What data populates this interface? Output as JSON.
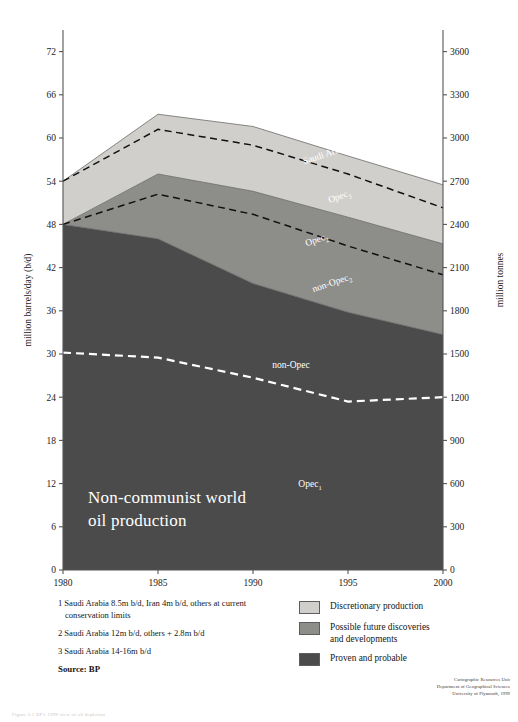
{
  "figure": {
    "source_label": "Source: BP",
    "caption": "Figure 2.1  BP's 1999 view of oil depletion"
  },
  "credit": {
    "line1": "Cartographic Resources Unit",
    "line2": "Department of Geographical Sciences",
    "line3": "University of Plymouth, 1999"
  },
  "axes": {
    "left_title": "million barrels/day (b/d)",
    "right_title": "million tonnes",
    "left_ticks": [
      "0",
      "6",
      "12",
      "18",
      "24",
      "30",
      "36",
      "42",
      "48",
      "54",
      "60",
      "66",
      "72"
    ],
    "right_ticks": [
      "0",
      "300",
      "600",
      "900",
      "1200",
      "1500",
      "1800",
      "2100",
      "2400",
      "2700",
      "3000",
      "3300",
      "3600"
    ],
    "x_ticks": [
      "1980",
      "1985",
      "1990",
      "1995",
      "2000"
    ]
  },
  "area_labels": {
    "saudi_arabia_3": "Saudi Arabia",
    "saudi_arabia_3_sub": "3",
    "opec_3": "Opec",
    "opec_3_sub": "3",
    "opec_2": "Opec",
    "opec_2_sub": "2",
    "non_opec_2": "non-Opec",
    "non_opec_2_sub": "2",
    "non_opec": "non-Opec",
    "opec_1": "Opec",
    "opec_1_sub": "1"
  },
  "notes": [
    {
      "index": "1",
      "text": "Saudi Arabia 8.5m b/d, Iran 4m b/d, others at current",
      "cont": "conservation limits"
    },
    {
      "index": "2",
      "text": "Saudi Arabia 12m b/d, others + 2.8m b/d",
      "cont": ""
    },
    {
      "index": "3",
      "text": "Saudi Arabia 14-16m b/d",
      "cont": ""
    }
  ],
  "legend": {
    "items": [
      {
        "label": "Discretionary production",
        "label2": "",
        "color": "#d0cfcb"
      },
      {
        "label": "Possible future discoveries",
        "label2": "and developments",
        "color": "#8d8d8a"
      },
      {
        "label": "Proven and probable",
        "label2": "",
        "color": "#4b4b4b"
      }
    ]
  },
  "colors": {
    "discretionary": "#d0cfcb",
    "possible": "#8d8d8a",
    "proven": "#4b4b4b",
    "axis": "#555555",
    "dash_dark": "#111111",
    "dash_white": "#ffffff"
  },
  "chart_data": {
    "type": "area",
    "xlabel": "",
    "ylabel": "million barrels/day (b/d)",
    "ylabel_right": "million tonnes",
    "xlim": [
      1980,
      2000
    ],
    "ylim": [
      0,
      75
    ],
    "ylim_right": [
      0,
      3750
    ],
    "grid": false,
    "legend_position": "bottom-right",
    "x": [
      1980,
      1985,
      1990,
      1995,
      2000
    ],
    "series": [
      {
        "name": "Proven and probable",
        "note": "cumulative top boundary of darkest band (Opec1 + non-Opec)",
        "values": [
          48.0,
          46.0,
          39.8,
          35.8,
          32.7
        ]
      },
      {
        "name": "Possible future discoveries and developments",
        "note": "cumulative top boundary of mid-grey band",
        "values": [
          48.0,
          55.0,
          52.6,
          49.0,
          45.3
        ]
      },
      {
        "name": "Discretionary production",
        "note": "cumulative top boundary of lightest band (total)",
        "values": [
          54.0,
          63.3,
          61.6,
          57.5,
          53.5
        ]
      }
    ],
    "dashed_lines": [
      {
        "name": "non-Opec (white dashed, inside darkest band)",
        "style": "dashed-white",
        "values": [
          30.2,
          29.5,
          26.7,
          23.4,
          24.0
        ]
      },
      {
        "name": "non-Opec2 (black dashed, inside mid band)",
        "style": "dashed-black",
        "values": [
          48.0,
          52.2,
          49.4,
          45.0,
          41.0
        ]
      },
      {
        "name": "Opec3 (black dashed, inside light band)",
        "style": "dashed-black",
        "values": [
          54.0,
          61.2,
          59.0,
          55.0,
          50.3
        ]
      }
    ],
    "annotations": [
      {
        "text": "Saudi Arabia3",
        "x": 1994.0,
        "y": 57.5
      },
      {
        "text": "Opec3",
        "x": 1994.6,
        "y": 51.5
      },
      {
        "text": "Opec2",
        "x": 1993.4,
        "y": 45.5
      },
      {
        "text": "non-Opec2",
        "x": 1994.2,
        "y": 39.5
      },
      {
        "text": "non-Opec",
        "x": 1992.0,
        "y": 28.0
      },
      {
        "text": "Opec1",
        "x": 1993.0,
        "y": 11.5
      }
    ]
  }
}
